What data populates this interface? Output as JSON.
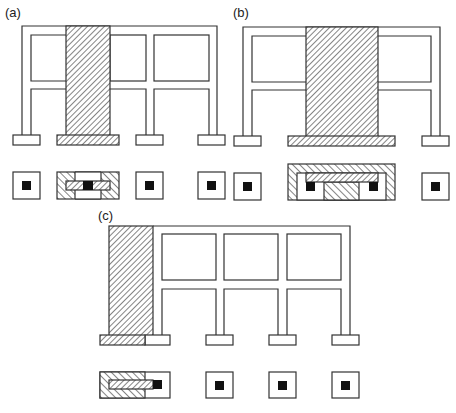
{
  "figure": {
    "panels": [
      {
        "id": "a",
        "label": "(a)",
        "description": "Frame with central shear wall spanning two bays, combined hatched footing"
      },
      {
        "id": "b",
        "label": "(b)",
        "description": "Frame with wide central shear wall and large combined footing"
      },
      {
        "id": "c",
        "label": "(c)",
        "description": "Frame with edge shear wall and eccentric combined footing"
      }
    ],
    "colors": {
      "line": "#333333",
      "hatch": "#333333",
      "column": "#111111",
      "background": "#ffffff"
    }
  }
}
